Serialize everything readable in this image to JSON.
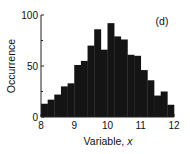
{
  "chart_data": {
    "type": "bar",
    "subtype": "histogram",
    "title": "",
    "panel_label": "(d)",
    "xlabel": "Variable, ",
    "xlabel_italic": "x",
    "ylabel": "Occurrence",
    "xlim": [
      8,
      12
    ],
    "ylim": [
      0,
      100
    ],
    "bin_width": 0.2,
    "x_ticks": [
      8,
      9,
      10,
      11,
      12
    ],
    "x_tick_labels": [
      "8",
      "9",
      "10",
      "11",
      "12"
    ],
    "y_ticks": [
      0,
      50,
      100
    ],
    "y_tick_labels": [
      "0",
      "50",
      "100"
    ],
    "grid": false,
    "legend": null,
    "bar_color": "#141414",
    "bin_edges": [
      8.0,
      8.2,
      8.4,
      8.6,
      8.8,
      9.0,
      9.2,
      9.4,
      9.6,
      9.8,
      10.0,
      10.2,
      10.4,
      10.6,
      10.8,
      11.0,
      11.2,
      11.4,
      11.6,
      11.8,
      12.0
    ],
    "categories": [
      "8.0-8.2",
      "8.2-8.4",
      "8.4-8.6",
      "8.6-8.8",
      "8.8-9.0",
      "9.0-9.2",
      "9.2-9.4",
      "9.4-9.6",
      "9.6-9.8",
      "9.8-10.0",
      "10.0-10.2",
      "10.2-10.4",
      "10.4-10.6",
      "10.6-10.8",
      "10.8-11.0",
      "11.0-11.2",
      "11.2-11.4",
      "11.4-11.6",
      "11.6-11.8",
      "11.8-12.0"
    ],
    "values": [
      13,
      17,
      22,
      30,
      33,
      51,
      55,
      70,
      86,
      66,
      92,
      79,
      76,
      61,
      60,
      46,
      36,
      21,
      25,
      12
    ]
  }
}
